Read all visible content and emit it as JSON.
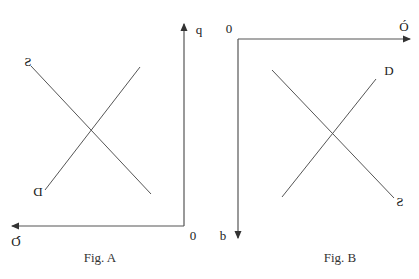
{
  "colors": {
    "background": "#ffffff",
    "axis": "#555555",
    "curve": "#555555",
    "text": "#222222"
  },
  "fig_a": {
    "caption": "Fig. A",
    "origin_label": "0",
    "vertical_axis_label": "q",
    "horizontal_axis_label": "Q",
    "supply_label": "S",
    "demand_label": "D",
    "mirrored": true
  },
  "fig_b": {
    "caption": "Fig. B",
    "origin_label": "0",
    "horizontal_axis_label": "Ó",
    "vertical_axis_label": "b",
    "demand_label": "D",
    "supply_label": "S",
    "mirrored_labels": [
      "S",
      "b"
    ]
  }
}
